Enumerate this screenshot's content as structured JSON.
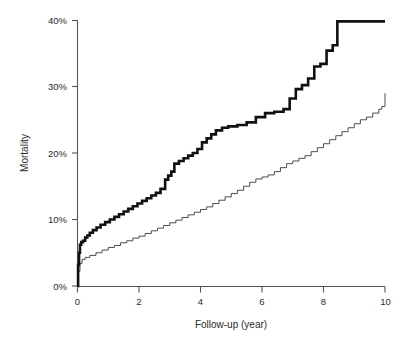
{
  "chart_data": {
    "type": "line",
    "subtype": "kaplan-meier-cumulative-step",
    "title": "",
    "xlabel": "Follow-up (year)",
    "ylabel": "Mortality",
    "xlim": [
      0,
      10
    ],
    "ylim": [
      0,
      40
    ],
    "xticks": [
      0,
      2,
      4,
      6,
      8,
      10
    ],
    "xtick_labels": [
      "0",
      "2",
      "4",
      "6",
      "8",
      "10"
    ],
    "yticks": [
      0,
      10,
      20,
      30,
      40
    ],
    "ytick_labels": [
      "0%",
      "10%",
      "20%",
      "30%",
      "40%"
    ],
    "y_unit": "%",
    "grid": false,
    "legend": null,
    "legend_position": "none",
    "series": [
      {
        "name": "high-risk group",
        "style": "bold-step",
        "color": "#111111",
        "line_width": 2.6,
        "final_value": 39.8,
        "x": [
          0,
          0.02,
          0.05,
          0.08,
          0.12,
          0.18,
          0.25,
          0.32,
          0.4,
          0.5,
          0.62,
          0.75,
          0.9,
          1.05,
          1.2,
          1.35,
          1.5,
          1.65,
          1.8,
          1.95,
          2.1,
          2.25,
          2.4,
          2.55,
          2.7,
          2.85,
          2.95,
          3.05,
          3.15,
          3.3,
          3.45,
          3.6,
          3.75,
          3.9,
          4.05,
          4.2,
          4.35,
          4.5,
          4.7,
          4.9,
          5.2,
          5.5,
          5.8,
          6.1,
          6.4,
          6.7,
          6.9,
          7.1,
          7.3,
          7.5,
          7.7,
          7.9,
          8.1,
          8.3,
          8.45,
          10
        ],
        "y": [
          0,
          3.2,
          5.0,
          6.2,
          6.6,
          6.8,
          7.3,
          7.6,
          8.0,
          8.4,
          8.8,
          9.2,
          9.6,
          10.0,
          10.4,
          10.8,
          11.2,
          11.6,
          12.0,
          12.4,
          12.8,
          13.2,
          13.6,
          14.0,
          14.6,
          16.0,
          16.6,
          17.2,
          18.4,
          18.8,
          19.2,
          19.6,
          20.0,
          20.6,
          21.6,
          22.2,
          22.8,
          23.4,
          23.8,
          24.0,
          24.2,
          24.6,
          25.4,
          26.0,
          26.2,
          26.6,
          28.2,
          29.6,
          30.2,
          31.2,
          33.0,
          33.4,
          35.4,
          36.2,
          39.8,
          39.8
        ]
      },
      {
        "name": "low-risk group",
        "style": "thin-step",
        "color": "#3a3a3a",
        "line_width": 0.9,
        "final_value": 29.0,
        "x": [
          0,
          0.03,
          0.08,
          0.15,
          0.25,
          0.4,
          0.6,
          0.8,
          1.0,
          1.2,
          1.4,
          1.6,
          1.8,
          2.0,
          2.2,
          2.4,
          2.6,
          2.8,
          3.0,
          3.2,
          3.4,
          3.6,
          3.8,
          4.0,
          4.2,
          4.4,
          4.6,
          4.8,
          5.0,
          5.2,
          5.4,
          5.6,
          5.8,
          6.0,
          6.2,
          6.4,
          6.6,
          6.8,
          7.0,
          7.2,
          7.4,
          7.6,
          7.8,
          8.0,
          8.2,
          8.4,
          8.6,
          8.8,
          9.0,
          9.2,
          9.4,
          9.6,
          9.8,
          9.9,
          10
        ],
        "y": [
          0,
          2.2,
          3.4,
          4.0,
          4.3,
          4.6,
          5.0,
          5.4,
          5.8,
          6.1,
          6.5,
          6.8,
          7.2,
          7.5,
          7.9,
          8.3,
          8.7,
          9.1,
          9.5,
          9.9,
          10.3,
          10.7,
          11.1,
          11.5,
          11.9,
          12.4,
          12.9,
          13.4,
          13.9,
          14.4,
          15.0,
          15.6,
          16.1,
          16.4,
          16.7,
          17.2,
          17.8,
          18.4,
          18.8,
          19.2,
          19.6,
          20.2,
          20.8,
          21.4,
          22.0,
          22.6,
          23.2,
          23.8,
          24.4,
          25.0,
          25.4,
          26.0,
          26.6,
          27.0,
          29.0
        ]
      }
    ]
  },
  "axes": {
    "y_title": "Mortality",
    "x_title": "Follow-up (year)",
    "y_tick_labels": [
      "40%",
      "30%",
      "20%",
      "10%",
      "0%"
    ],
    "x_tick_labels": [
      "0",
      "2",
      "4",
      "6",
      "8",
      "10"
    ]
  },
  "colors": {
    "background": "#ffffff",
    "axis": "#555555",
    "text": "#2b2b2b",
    "series_bold": "#111111",
    "series_thin": "#3a3a3a"
  }
}
